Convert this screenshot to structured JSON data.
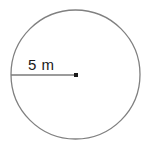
{
  "figure": {
    "type": "geometry-diagram",
    "background_color": "#ffffff",
    "width": 147,
    "height": 149,
    "circle": {
      "name": "circle-outline",
      "center_x": 75.5,
      "center_y": 74.5,
      "radius": 64.5,
      "stroke_color": "#808080",
      "stroke_width": 1.3,
      "fill": "none"
    },
    "radius_segment": {
      "name": "radius-line",
      "from_x": 11,
      "from_y": 75,
      "to_x": 76,
      "to_y": 75,
      "stroke_color": "#7a7a7a",
      "stroke_width": 1.3
    },
    "center_point": {
      "name": "center-dot",
      "x": 76,
      "y": 75,
      "size": 4,
      "color": "#1a1a1a"
    },
    "label": {
      "text": "5 m",
      "value": "5",
      "unit": "m",
      "color": "#1a1a1a",
      "font_size": 15
    }
  }
}
